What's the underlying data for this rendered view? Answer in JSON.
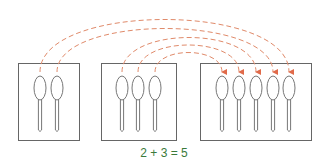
{
  "diagram": {
    "equation": "2 + 3 = 5",
    "colors": {
      "box": "#666666",
      "spoon": "#777777",
      "arrow": "#e06a4a",
      "equation": "#3a7a3a"
    },
    "groups": [
      {
        "name": "group-a",
        "count": 2
      },
      {
        "name": "group-b",
        "count": 3
      },
      {
        "name": "group-total",
        "count": 5
      }
    ]
  }
}
